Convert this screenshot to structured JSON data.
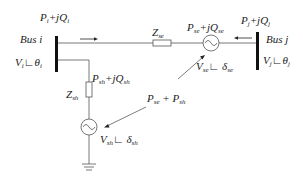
{
  "diagram": {
    "labels": {
      "pi_qi": "P_i+jQ_i",
      "bus_i": "Bus i",
      "vi": "V_i∠θ_i",
      "zse": "Z_se",
      "pse_qse": "P_se+jQ_se",
      "pj_qj": "P_j+jQ_j",
      "bus_j": "Bus j",
      "vj": "V_j∠θ_j",
      "vse": "V_se∠δ_se",
      "psh_qsh": "P_sh+jQ_sh",
      "zsh": "Z_sh",
      "pse_psh": "P_se + P_sh",
      "vsh": "V_sh∠δ_sh"
    },
    "nodes": [
      {
        "id": "bus-i",
        "type": "bus"
      },
      {
        "id": "bus-j",
        "type": "bus"
      },
      {
        "id": "zse",
        "type": "impedance"
      },
      {
        "id": "vse",
        "type": "ac-source"
      },
      {
        "id": "zsh",
        "type": "impedance"
      },
      {
        "id": "vsh",
        "type": "ac-source"
      },
      {
        "id": "ground",
        "type": "ground"
      }
    ],
    "edges": [
      {
        "from": "bus-i",
        "to": "zse"
      },
      {
        "from": "zse",
        "to": "vse"
      },
      {
        "from": "vse",
        "to": "bus-j"
      },
      {
        "from": "bus-i",
        "to": "zsh"
      },
      {
        "from": "zsh",
        "to": "vsh"
      },
      {
        "from": "vsh",
        "to": "ground"
      },
      {
        "from": "vse",
        "to": "vsh",
        "label": "P_se + P_sh",
        "style": "arrow"
      }
    ]
  }
}
